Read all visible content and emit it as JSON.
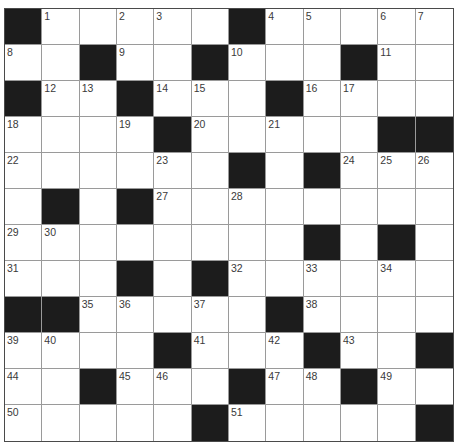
{
  "puzzle": {
    "rows": 12,
    "cols": 12,
    "colors": {
      "block": "#1c1c1c",
      "cell": "#ffffff",
      "grid_line": "#9a9a9a",
      "border": "#4a4a4a",
      "number": "#3a3a3a"
    },
    "layout": [
      "#.....#.....",
      "..#..#...#..",
      "#..#...#....",
      "....#.....##",
      "......#.#...",
      ".#.#........",
      "........#.#.",
      "...#.#......",
      "##.....#....",
      "....#...#..#",
      "..#...#..#..",
      ".....#.....#"
    ],
    "numbers": [
      {
        "n": "1",
        "r": 0,
        "c": 1
      },
      {
        "n": "2",
        "r": 0,
        "c": 3
      },
      {
        "n": "3",
        "r": 0,
        "c": 4
      },
      {
        "n": "4",
        "r": 0,
        "c": 7
      },
      {
        "n": "5",
        "r": 0,
        "c": 8
      },
      {
        "n": "6",
        "r": 0,
        "c": 10
      },
      {
        "n": "7",
        "r": 0,
        "c": 11
      },
      {
        "n": "8",
        "r": 1,
        "c": 0
      },
      {
        "n": "9",
        "r": 1,
        "c": 3
      },
      {
        "n": "10",
        "r": 1,
        "c": 6
      },
      {
        "n": "11",
        "r": 1,
        "c": 10
      },
      {
        "n": "12",
        "r": 2,
        "c": 1
      },
      {
        "n": "13",
        "r": 2,
        "c": 2
      },
      {
        "n": "14",
        "r": 2,
        "c": 4
      },
      {
        "n": "15",
        "r": 2,
        "c": 5
      },
      {
        "n": "16",
        "r": 2,
        "c": 8
      },
      {
        "n": "17",
        "r": 2,
        "c": 9
      },
      {
        "n": "18",
        "r": 3,
        "c": 0
      },
      {
        "n": "19",
        "r": 3,
        "c": 3
      },
      {
        "n": "20",
        "r": 3,
        "c": 5
      },
      {
        "n": "21",
        "r": 3,
        "c": 7
      },
      {
        "n": "22",
        "r": 4,
        "c": 0
      },
      {
        "n": "23",
        "r": 4,
        "c": 4
      },
      {
        "n": "24",
        "r": 4,
        "c": 9
      },
      {
        "n": "25",
        "r": 4,
        "c": 10
      },
      {
        "n": "26",
        "r": 4,
        "c": 11
      },
      {
        "n": "27",
        "r": 5,
        "c": 4
      },
      {
        "n": "28",
        "r": 5,
        "c": 6
      },
      {
        "n": "29",
        "r": 6,
        "c": 0
      },
      {
        "n": "30",
        "r": 6,
        "c": 1
      },
      {
        "n": "31",
        "r": 7,
        "c": 0
      },
      {
        "n": "32",
        "r": 7,
        "c": 6
      },
      {
        "n": "33",
        "r": 7,
        "c": 8
      },
      {
        "n": "34",
        "r": 7,
        "c": 10
      },
      {
        "n": "35",
        "r": 8,
        "c": 2
      },
      {
        "n": "36",
        "r": 8,
        "c": 3
      },
      {
        "n": "37",
        "r": 8,
        "c": 5
      },
      {
        "n": "38",
        "r": 8,
        "c": 8
      },
      {
        "n": "39",
        "r": 9,
        "c": 0
      },
      {
        "n": "40",
        "r": 9,
        "c": 1
      },
      {
        "n": "41",
        "r": 9,
        "c": 5
      },
      {
        "n": "42",
        "r": 9,
        "c": 7
      },
      {
        "n": "43",
        "r": 9,
        "c": 9
      },
      {
        "n": "44",
        "r": 10,
        "c": 0
      },
      {
        "n": "45",
        "r": 10,
        "c": 3
      },
      {
        "n": "46",
        "r": 10,
        "c": 4
      },
      {
        "n": "47",
        "r": 10,
        "c": 7
      },
      {
        "n": "48",
        "r": 10,
        "c": 8
      },
      {
        "n": "49",
        "r": 10,
        "c": 10
      },
      {
        "n": "50",
        "r": 11,
        "c": 0
      },
      {
        "n": "51",
        "r": 11,
        "c": 6
      }
    ]
  }
}
